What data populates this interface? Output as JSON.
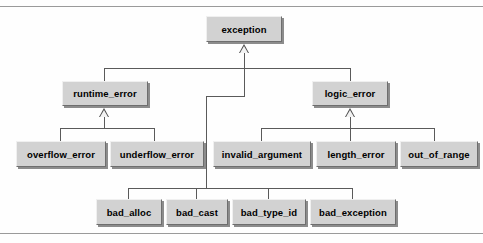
{
  "diagram": {
    "type": "uml-class-inheritance",
    "colors": {
      "node_fill": "#d2d2d2",
      "node_highlight": "#f0f0f0",
      "node_shade": "#6e6e6e",
      "node_shadow": "#8c8c8c",
      "connector": "#5a5a5a",
      "rule": "#9a9a9a",
      "text": "#000000",
      "background": "#fefefe"
    },
    "nodes": {
      "exception": {
        "label": "exception",
        "x": 206,
        "y": 16,
        "w": 76,
        "h": 26
      },
      "runtime_error": {
        "label": "runtime_error",
        "x": 62,
        "y": 81,
        "w": 86,
        "h": 25
      },
      "logic_error": {
        "label": "logic_error",
        "x": 312,
        "y": 81,
        "w": 76,
        "h": 25
      },
      "overflow_error": {
        "label": "overflow_error",
        "x": 16,
        "y": 141,
        "w": 90,
        "h": 26
      },
      "underflow_error": {
        "label": "underflow_error",
        "x": 110,
        "y": 141,
        "w": 94,
        "h": 26
      },
      "invalid_argument": {
        "label": "invalid_argument",
        "x": 213,
        "y": 141,
        "w": 98,
        "h": 26
      },
      "length_error": {
        "label": "length_error",
        "x": 316,
        "y": 141,
        "w": 80,
        "h": 26
      },
      "out_of_range": {
        "label": "out_of_range",
        "x": 400,
        "y": 141,
        "w": 78,
        "h": 26
      },
      "bad_alloc": {
        "label": "bad_alloc",
        "x": 96,
        "y": 199,
        "w": 66,
        "h": 26
      },
      "bad_cast": {
        "label": "bad_cast",
        "x": 166,
        "y": 199,
        "w": 62,
        "h": 26
      },
      "bad_type_id": {
        "label": "bad_type_id",
        "x": 232,
        "y": 199,
        "w": 74,
        "h": 26
      },
      "bad_exception": {
        "label": "bad_exception",
        "x": 310,
        "y": 199,
        "w": 86,
        "h": 26
      }
    },
    "edges": [
      {
        "from": "runtime_error",
        "to": "exception",
        "relation": "inherits"
      },
      {
        "from": "logic_error",
        "to": "exception",
        "relation": "inherits"
      },
      {
        "from": "bad_alloc",
        "to": "exception",
        "relation": "inherits"
      },
      {
        "from": "bad_cast",
        "to": "exception",
        "relation": "inherits"
      },
      {
        "from": "bad_type_id",
        "to": "exception",
        "relation": "inherits"
      },
      {
        "from": "bad_exception",
        "to": "exception",
        "relation": "inherits"
      },
      {
        "from": "overflow_error",
        "to": "runtime_error",
        "relation": "inherits"
      },
      {
        "from": "underflow_error",
        "to": "runtime_error",
        "relation": "inherits"
      },
      {
        "from": "invalid_argument",
        "to": "logic_error",
        "relation": "inherits"
      },
      {
        "from": "length_error",
        "to": "logic_error",
        "relation": "inherits"
      },
      {
        "from": "out_of_range",
        "to": "logic_error",
        "relation": "inherits"
      }
    ]
  }
}
